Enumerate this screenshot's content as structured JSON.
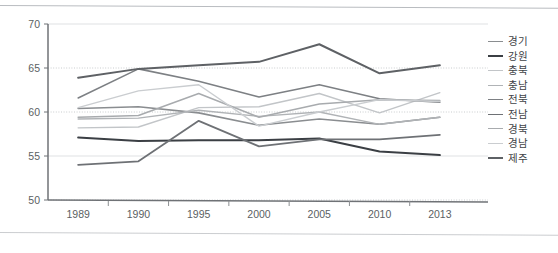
{
  "chart_data": {
    "type": "line",
    "title": "",
    "xlabel": "",
    "ylabel": "",
    "x": [
      "1989",
      "1990",
      "1995",
      "2000",
      "2005",
      "2010",
      "2013"
    ],
    "ylim": [
      50,
      70
    ],
    "yticks": [
      50,
      55,
      60,
      65,
      70
    ],
    "grid": true,
    "legend_position": "right",
    "series": [
      {
        "name": "경기",
        "color": "#8a8d90",
        "width": 1.6,
        "values": [
          60.4,
          60.6,
          59.9,
          58.5,
          59.2,
          58.6,
          59.4
        ]
      },
      {
        "name": "강원",
        "color": "#3b3f44",
        "width": 2.0,
        "values": [
          57.1,
          56.7,
          56.8,
          56.8,
          57.0,
          55.5,
          55.1
        ]
      },
      {
        "name": "충북",
        "color": "#c2c5c8",
        "width": 1.4,
        "values": [
          58.2,
          58.3,
          60.5,
          60.6,
          62.1,
          59.9,
          62.2
        ]
      },
      {
        "name": "충남",
        "color": "#b0b3b6",
        "width": 1.4,
        "values": [
          59.2,
          59.3,
          60.2,
          59.5,
          60.0,
          58.6,
          59.4
        ]
      },
      {
        "name": "전북",
        "color": "#7d8084",
        "width": 1.6,
        "values": [
          61.6,
          64.9,
          63.5,
          61.7,
          63.1,
          61.5,
          61.1
        ]
      },
      {
        "name": "전남",
        "color": "#6e7175",
        "width": 1.8,
        "values": [
          54.0,
          54.4,
          59.0,
          56.1,
          56.9,
          56.9,
          57.4
        ]
      },
      {
        "name": "경북",
        "color": "#a8abae",
        "width": 1.5,
        "values": [
          59.4,
          59.6,
          62.1,
          59.4,
          60.9,
          61.4,
          61.3
        ]
      },
      {
        "name": "경남",
        "color": "#cacdd0",
        "width": 1.4,
        "values": [
          60.5,
          62.4,
          63.1,
          58.4,
          60.0,
          61.4,
          61.2
        ]
      },
      {
        "name": "제주",
        "color": "#5e6165",
        "width": 2.0,
        "values": [
          63.9,
          64.9,
          65.3,
          65.7,
          67.7,
          64.4,
          65.3
        ]
      }
    ]
  },
  "axis": {
    "y_labels": [
      "70",
      "65",
      "60",
      "55",
      "50"
    ],
    "x_labels": [
      "1989",
      "1990",
      "1995",
      "2000",
      "2005",
      "2010",
      "2013"
    ]
  },
  "legend": {
    "items": [
      {
        "label": "경기"
      },
      {
        "label": "강원"
      },
      {
        "label": "충북"
      },
      {
        "label": "충남"
      },
      {
        "label": "전북"
      },
      {
        "label": "전남"
      },
      {
        "label": "경북"
      },
      {
        "label": "경남"
      },
      {
        "label": "제주"
      }
    ]
  }
}
